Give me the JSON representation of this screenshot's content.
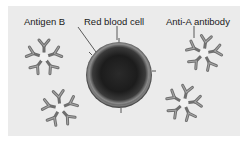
{
  "diagram": {
    "labels": {
      "antigen": "Antigen B",
      "cell": "Red blood cell",
      "antibody": "Anti-A antibody"
    },
    "colors": {
      "background": "#ebebeb",
      "page": "#ffffff",
      "cell_dark": "#1e1e1e",
      "cell_rim": "#7a7a7a",
      "antibody": "#6f6f6f",
      "antibody_light": "#a6a6a6",
      "text": "#1a1a1a"
    },
    "elements": {
      "red_blood_cell": {
        "cx": 119,
        "cy": 75,
        "r": 33
      },
      "antibodies": [
        {
          "id": "top-left",
          "cx": 44,
          "cy": 57
        },
        {
          "id": "top-right",
          "cx": 204,
          "cy": 53
        },
        {
          "id": "bottom-left",
          "cx": 60,
          "cy": 108
        },
        {
          "id": "bottom-right",
          "cx": 184,
          "cy": 103
        }
      ]
    }
  }
}
